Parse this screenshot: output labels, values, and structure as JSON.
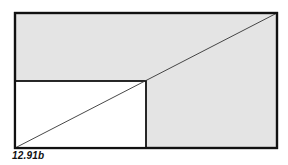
{
  "figure": {
    "label": "12.91b",
    "colors": {
      "outer_fill": "#e4e4e4",
      "inner_fill": "#ffffff",
      "stroke": "#111111",
      "diagonal": "#333333"
    },
    "outer_rect": {
      "x": 15,
      "y": 13,
      "width": 262,
      "height": 135
    },
    "inner_rect": {
      "x": 15,
      "y": 81,
      "width": 131,
      "height": 67
    },
    "diagonal": {
      "x1": 15,
      "y1": 148,
      "x2": 277,
      "y2": 13
    }
  }
}
